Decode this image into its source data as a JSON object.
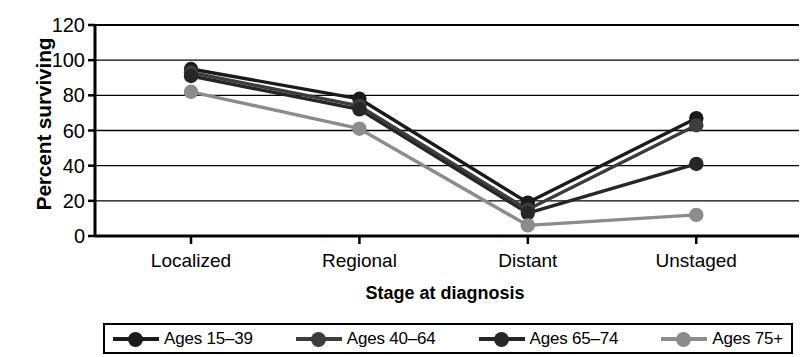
{
  "chart_data": {
    "type": "line",
    "title": "",
    "xlabel": "Stage at diagnosis",
    "ylabel": "Percent surviving",
    "categories": [
      "Localized",
      "Regional",
      "Distant",
      "Unstaged"
    ],
    "ylim": [
      0,
      120
    ],
    "yticks": [
      0,
      20,
      40,
      60,
      80,
      100,
      120
    ],
    "ytick_labels": [
      "0",
      "20",
      "40",
      "60",
      "80",
      "100",
      "120"
    ],
    "grid": true,
    "legend_position": "bottom",
    "series": [
      {
        "name": "Ages 15–39",
        "color": "#1a1a1a",
        "values": [
          95,
          78,
          19,
          67
        ]
      },
      {
        "name": "Ages 40–64",
        "color": "#3d3d3d",
        "values": [
          93,
          74,
          15,
          63
        ]
      },
      {
        "name": "Ages 65–74",
        "color": "#262626",
        "values": [
          91,
          72,
          13,
          41
        ]
      },
      {
        "name": "Ages 75+",
        "color": "#8c8c8c",
        "values": [
          82,
          61,
          6,
          12
        ]
      }
    ]
  },
  "axes": {
    "y_title": "Percent surviving",
    "x_title": "Stage at diagnosis"
  },
  "legend": {
    "items": [
      {
        "label": "Ages 15–39"
      },
      {
        "label": "Ages 40–64"
      },
      {
        "label": "Ages 65–74"
      },
      {
        "label": "Ages 75+"
      }
    ]
  }
}
